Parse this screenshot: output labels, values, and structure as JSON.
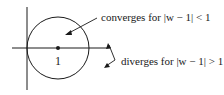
{
  "diagram": {
    "center_label": "1",
    "inside_label": "converges for |w − 1| < 1",
    "outside_label": "diverges for |w − 1| > 1",
    "stroke_color": "#1a1a1a"
  }
}
